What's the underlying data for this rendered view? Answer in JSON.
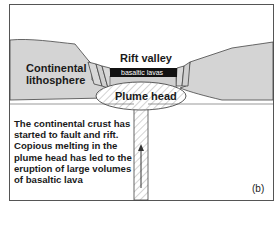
{
  "diagram": {
    "panel_label": "(b)",
    "labels": {
      "continental_lithosphere_line1": "Continental",
      "continental_lithosphere_line2": "lithosphere",
      "rift_valley": "Rift valley",
      "basaltic_lavas": "basaltic lavas",
      "plume_head": "Plume head"
    },
    "caption_lines": [
      "The continental crust has",
      "started to fault and rift.",
      "Copious melting in the",
      "plume head has led to the",
      "eruption of large volumes",
      "of basaltic lava"
    ],
    "colors": {
      "lithosphere_fill": "#d2d2d2",
      "outline": "#333333",
      "lava_fill": "#111111",
      "hatch": "#9a9a9a",
      "background": "#ffffff"
    }
  }
}
